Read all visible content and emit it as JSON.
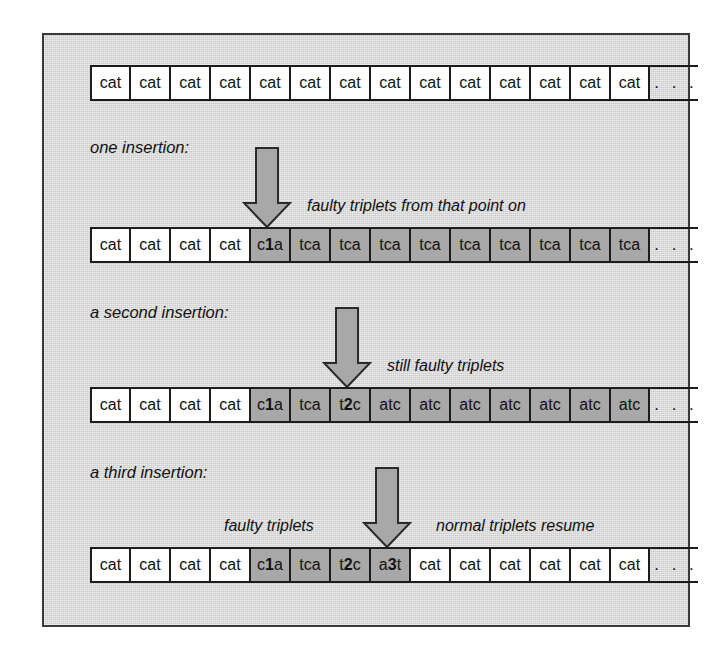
{
  "figure": {
    "colors": {
      "panel_background": "#d9d9d9",
      "panel_border": "#3a3a3a",
      "normal_cell": "#ffffff",
      "faulty_cell": "#a8a8a8",
      "arrow_fill": "#a8a8a8",
      "arrow_stroke": "#2a2a2a",
      "text": "#111111"
    },
    "ellipsis": ". . .",
    "rows": [
      {
        "id": "row-original",
        "label": "",
        "annotation": "",
        "cells": [
          {
            "text": "cat",
            "state": "normal"
          },
          {
            "text": "cat",
            "state": "normal"
          },
          {
            "text": "cat",
            "state": "normal"
          },
          {
            "text": "cat",
            "state": "normal"
          },
          {
            "text": "cat",
            "state": "normal"
          },
          {
            "text": "cat",
            "state": "normal"
          },
          {
            "text": "cat",
            "state": "normal"
          },
          {
            "text": "cat",
            "state": "normal"
          },
          {
            "text": "cat",
            "state": "normal"
          },
          {
            "text": "cat",
            "state": "normal"
          },
          {
            "text": "cat",
            "state": "normal"
          },
          {
            "text": "cat",
            "state": "normal"
          },
          {
            "text": "cat",
            "state": "normal"
          },
          {
            "text": "cat",
            "state": "normal"
          }
        ]
      },
      {
        "id": "row-one-insertion",
        "label": "one insertion:",
        "annotation": "faulty triplets from that point on",
        "cells": [
          {
            "text": "cat",
            "state": "normal"
          },
          {
            "text": "cat",
            "state": "normal"
          },
          {
            "text": "cat",
            "state": "normal"
          },
          {
            "text": "cat",
            "state": "normal"
          },
          {
            "text": "c1a",
            "state": "faulty",
            "bold_index": 1
          },
          {
            "text": "tca",
            "state": "faulty"
          },
          {
            "text": "tca",
            "state": "faulty"
          },
          {
            "text": "tca",
            "state": "faulty"
          },
          {
            "text": "tca",
            "state": "faulty"
          },
          {
            "text": "tca",
            "state": "faulty"
          },
          {
            "text": "tca",
            "state": "faulty"
          },
          {
            "text": "tca",
            "state": "faulty"
          },
          {
            "text": "tca",
            "state": "faulty"
          },
          {
            "text": "tca",
            "state": "faulty"
          }
        ]
      },
      {
        "id": "row-second-insertion",
        "label": "a second insertion:",
        "annotation": "still faulty triplets",
        "cells": [
          {
            "text": "cat",
            "state": "normal"
          },
          {
            "text": "cat",
            "state": "normal"
          },
          {
            "text": "cat",
            "state": "normal"
          },
          {
            "text": "cat",
            "state": "normal"
          },
          {
            "text": "c1a",
            "state": "faulty",
            "bold_index": 1
          },
          {
            "text": "tca",
            "state": "faulty"
          },
          {
            "text": "t2c",
            "state": "faulty",
            "bold_index": 1
          },
          {
            "text": "atc",
            "state": "faulty"
          },
          {
            "text": "atc",
            "state": "faulty"
          },
          {
            "text": "atc",
            "state": "faulty"
          },
          {
            "text": "atc",
            "state": "faulty"
          },
          {
            "text": "atc",
            "state": "faulty"
          },
          {
            "text": "atc",
            "state": "faulty"
          },
          {
            "text": "atc",
            "state": "faulty"
          }
        ]
      },
      {
        "id": "row-third-insertion",
        "label": "a third insertion:",
        "annotation_left": "faulty triplets",
        "annotation_right": "normal triplets resume",
        "cells": [
          {
            "text": "cat",
            "state": "normal"
          },
          {
            "text": "cat",
            "state": "normal"
          },
          {
            "text": "cat",
            "state": "normal"
          },
          {
            "text": "cat",
            "state": "normal"
          },
          {
            "text": "c1a",
            "state": "faulty",
            "bold_index": 1
          },
          {
            "text": "tca",
            "state": "faulty"
          },
          {
            "text": "t2c",
            "state": "faulty",
            "bold_index": 1
          },
          {
            "text": "a3t",
            "state": "faulty",
            "bold_index": 1
          },
          {
            "text": "cat",
            "state": "normal"
          },
          {
            "text": "cat",
            "state": "normal"
          },
          {
            "text": "cat",
            "state": "normal"
          },
          {
            "text": "cat",
            "state": "normal"
          },
          {
            "text": "cat",
            "state": "normal"
          },
          {
            "text": "cat",
            "state": "normal"
          }
        ]
      }
    ],
    "arrows": [
      {
        "id": "insertion-arrow-1",
        "points_to": "c1a",
        "direction": "down"
      },
      {
        "id": "insertion-arrow-2",
        "points_to": "t2c",
        "direction": "down"
      },
      {
        "id": "insertion-arrow-3",
        "points_to": "a3t",
        "direction": "down"
      }
    ]
  }
}
